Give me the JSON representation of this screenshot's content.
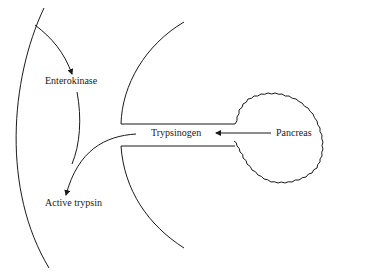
{
  "diagram": {
    "type": "flow-diagram",
    "labels": {
      "enterokinase": "Enterokinase",
      "trypsinogen": "Trypsinogen",
      "pancreas": "Pancreas",
      "active_trypsin": "Active trypsin"
    },
    "arrows": [
      {
        "from": "Pancreas",
        "to": "Trypsinogen"
      },
      {
        "from": "intestinal wall",
        "to": "Enterokinase"
      },
      {
        "from": "Trypsinogen",
        "to": "Active trypsin"
      },
      {
        "from": "Enterokinase",
        "to": "Active trypsin"
      }
    ],
    "colors": {
      "line": "#1a1a1a",
      "background": "#ffffff"
    }
  }
}
